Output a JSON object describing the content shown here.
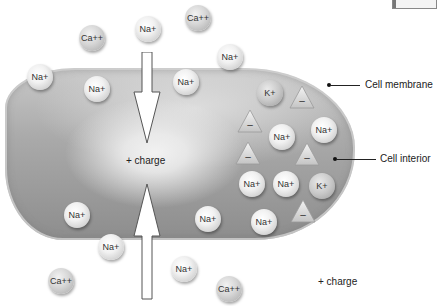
{
  "diagram": {
    "labels": {
      "cell_membrane": "Cell membrane",
      "cell_interior": "Cell interior",
      "charge_inside": "+ charge",
      "charge_outside": "+ charge"
    },
    "ions": [
      {
        "label": "Ca++",
        "type": "ca",
        "x": 92,
        "y": 38
      },
      {
        "label": "Na+",
        "type": "na",
        "x": 148,
        "y": 29
      },
      {
        "label": "Ca++",
        "type": "ca",
        "x": 198,
        "y": 18
      },
      {
        "label": "Na+",
        "type": "na",
        "x": 40,
        "y": 77
      },
      {
        "label": "Na+",
        "type": "na",
        "x": 97,
        "y": 89
      },
      {
        "label": "Na+",
        "type": "na",
        "x": 186,
        "y": 82
      },
      {
        "label": "Na+",
        "type": "na",
        "x": 230,
        "y": 57
      },
      {
        "label": "K+",
        "type": "k",
        "x": 270,
        "y": 93
      },
      {
        "label": "Na+",
        "type": "na",
        "x": 282,
        "y": 137
      },
      {
        "label": "Na+",
        "type": "na",
        "x": 324,
        "y": 130
      },
      {
        "label": "Na+",
        "type": "na",
        "x": 252,
        "y": 184
      },
      {
        "label": "Na+",
        "type": "na",
        "x": 286,
        "y": 184
      },
      {
        "label": "K+",
        "type": "k",
        "x": 322,
        "y": 186
      },
      {
        "label": "Na+",
        "type": "na",
        "x": 264,
        "y": 222
      },
      {
        "label": "Na+",
        "type": "na",
        "x": 77,
        "y": 215
      },
      {
        "label": "Na+",
        "type": "na",
        "x": 208,
        "y": 219
      },
      {
        "label": "Na+",
        "type": "na",
        "x": 111,
        "y": 247
      },
      {
        "label": "Na+",
        "type": "na",
        "x": 184,
        "y": 269
      },
      {
        "label": "Ca++",
        "type": "ca",
        "x": 61,
        "y": 281
      },
      {
        "label": "Ca++",
        "type": "ca",
        "x": 229,
        "y": 289
      }
    ],
    "anions": [
      {
        "label": "–",
        "x": 302,
        "y": 97
      },
      {
        "label": "–",
        "x": 250,
        "y": 121
      },
      {
        "label": "–",
        "x": 248,
        "y": 153
      },
      {
        "label": "–",
        "x": 307,
        "y": 154
      },
      {
        "label": "–",
        "x": 303,
        "y": 211
      }
    ],
    "colors": {
      "background": "#ffffff",
      "cell_fill": "#a8a8a8",
      "text": "#222222"
    }
  }
}
